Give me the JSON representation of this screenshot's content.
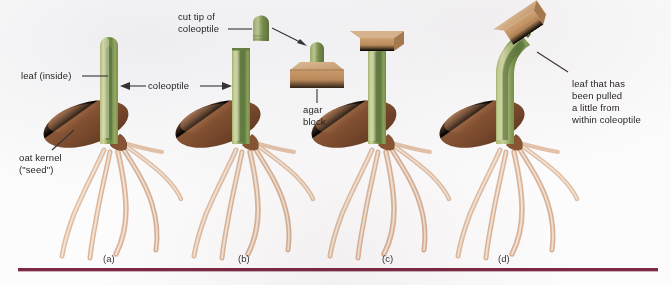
{
  "figure": {
    "background_color": "#fdfcfc",
    "rule_color": "#7d2a42"
  },
  "labels": {
    "leaf_inside": "leaf (inside)",
    "coleoptile": "coleoptile",
    "cut_tip_line1": "cut tip of",
    "cut_tip_line2": "coleoptile",
    "agar_line1": "agar",
    "agar_line2": "block",
    "oat_kernel_line1": "oat kernel",
    "oat_kernel_line2": "(\"seed\")",
    "leaf_pulled_line1": "leaf that has",
    "leaf_pulled_line2": "been pulled",
    "leaf_pulled_line3": "a little from",
    "leaf_pulled_line4": "within coleoptile"
  },
  "panels": [
    {
      "id": "a",
      "label": "(a)",
      "description": "intact oat seedling with coleoptile enclosing leaf"
    },
    {
      "id": "b",
      "label": "(b)",
      "description": "coleoptile with tip cut off; cut tip placed on agar block"
    },
    {
      "id": "c",
      "label": "(c)",
      "description": "agar block placed squarely on cut coleoptile, growth straight"
    },
    {
      "id": "d",
      "label": "(d)",
      "description": "agar block placed off-center, coleoptile bends"
    }
  ],
  "colors": {
    "coleoptile_light": "#c9d08a",
    "coleoptile_mid": "#9caf63",
    "leaf_dark": "#5d7a44",
    "kernel_brown": "#8d5a3b",
    "kernel_light": "#b5825c",
    "root_tan": "#e3c4ab",
    "agar_tan": "#c69a6d",
    "text": "#241f20"
  }
}
